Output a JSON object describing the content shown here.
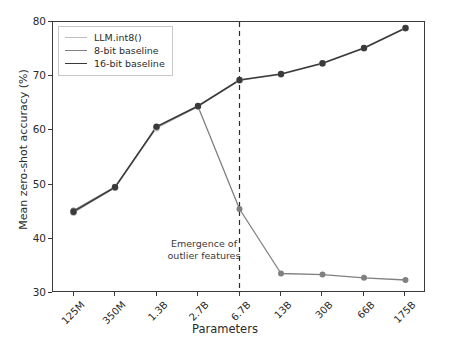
{
  "chart_data": {
    "type": "line",
    "title": "",
    "xlabel": "Parameters",
    "ylabel": "Mean zero-shot accuracy (%)",
    "categories": [
      "125M",
      "350M",
      "1.3B",
      "2.7B",
      "6.7B",
      "13B",
      "30B",
      "66B",
      "175B"
    ],
    "ylim": [
      30,
      80
    ],
    "yticks": [
      30,
      40,
      50,
      60,
      70,
      80
    ],
    "grid": false,
    "legend_position": "upper left",
    "series": [
      {
        "name": "LLM.int8()",
        "color": "#bfbfbf",
        "values": [
          44.8,
          49.4,
          60.4,
          64.4,
          69.2,
          70.3,
          72.3,
          75.1,
          78.8
        ]
      },
      {
        "name": "8-bit baseline",
        "color": "#808080",
        "values": [
          45.2,
          49.6,
          60.6,
          64.4,
          45.5,
          33.6,
          33.4,
          32.8,
          32.4
        ]
      },
      {
        "name": "16-bit baseline",
        "color": "#3a3a3a",
        "values": [
          45.0,
          49.5,
          60.7,
          64.5,
          69.3,
          70.4,
          72.4,
          75.2,
          78.9
        ]
      }
    ],
    "annotations": [
      {
        "name": "emergence-of-outlier-features",
        "text_line1": "Emergence of",
        "text_line2": "outlier features",
        "vline_at_category": "6.7B",
        "vline_style": "dashed"
      }
    ]
  }
}
